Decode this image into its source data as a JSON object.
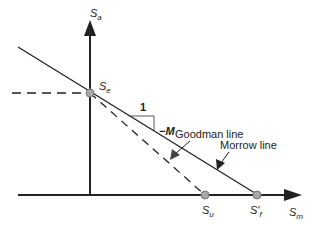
{
  "diagram": {
    "type": "mean-stress fatigue diagram",
    "axes": {
      "y_label": "S",
      "y_label_sub": "a",
      "x_label": "S",
      "x_label_sub": "m"
    },
    "points": {
      "endurance": {
        "label": "S",
        "sub": "e"
      },
      "ultimate": {
        "label": "S",
        "sub": "u"
      },
      "fracture": {
        "label": "S'",
        "sub": "f"
      }
    },
    "slope": {
      "run": "1",
      "rise": "−M"
    },
    "lines": {
      "goodman": "Goodman line",
      "morrow": "Morrow line"
    },
    "colors": {
      "line": "#222222",
      "point_fill": "#a8a8a8",
      "point_stroke": "#777777",
      "background": "#ffffff"
    }
  }
}
